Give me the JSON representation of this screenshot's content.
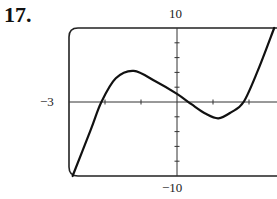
{
  "problem": {
    "number": "17."
  },
  "chart_data": {
    "type": "line",
    "title": "",
    "xlabel": "",
    "ylabel": "",
    "xlim": [
      -3,
      3
    ],
    "ylim": [
      -10,
      10
    ],
    "x_tick_step": 1,
    "y_tick_step": 2,
    "grid": false,
    "labels": {
      "y_max": "10",
      "y_min": "-10",
      "x_min": "−3"
    },
    "axis_labels_display": {
      "y_max": "10",
      "y_min": "−10",
      "x_min": "−3"
    },
    "series": [
      {
        "name": "f(x)",
        "x": [
          -2.9,
          -2.4,
          -2.1,
          -1.7,
          -1.2,
          -0.6,
          0.0,
          0.4,
          0.8,
          1.15,
          1.5,
          1.85,
          2.25,
          2.7
        ],
        "y": [
          -10,
          -3.8,
          0,
          3.2,
          4.2,
          2.8,
          1.1,
          -0.3,
          -1.6,
          -2.2,
          -1.4,
          0,
          4.3,
          10
        ]
      }
    ],
    "features": {
      "local_max": {
        "x": -1.2,
        "y": 4.2
      },
      "local_min": {
        "x": 1.15,
        "y": -2.2
      },
      "y_intercept": 1.1
    }
  }
}
